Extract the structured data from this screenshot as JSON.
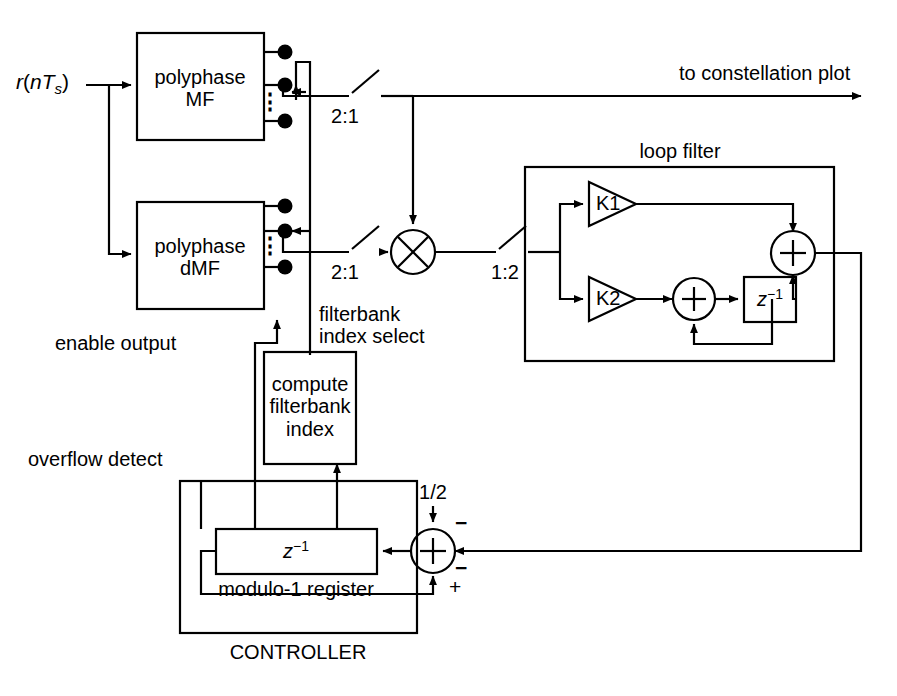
{
  "diagram": {
    "background_color": "#ffffff",
    "line_color": "#000000",
    "width": 897,
    "height": 696
  },
  "blocks": {
    "polyphase_mf": {
      "line1": "polyphase",
      "line2": "MF"
    },
    "polyphase_dmf": {
      "line1": "polyphase",
      "line2": "dMF"
    },
    "compute_index": {
      "line1": "compute",
      "line2": "filterbank",
      "line3": "index"
    },
    "gain_k1": {
      "label": "K1"
    },
    "gain_k2": {
      "label": "K2"
    },
    "delay_loop": {
      "base": "z",
      "exponent": "−1"
    },
    "delay_controller": {
      "base": "z",
      "exponent": "−1"
    }
  },
  "operators": {
    "multiplier": {
      "glyph": "×",
      "name": "multiplier"
    },
    "adder_loop_output": {
      "glyph": "+",
      "name": "summer"
    },
    "adder_loop_inner": {
      "glyph": "+",
      "name": "summer"
    },
    "adder_controller": {
      "glyph": "+",
      "name": "summer"
    }
  },
  "labels": {
    "input_signal": {
      "r": "r",
      "paren_open": "(",
      "n": "n",
      "T": "T",
      "s": "s",
      "paren_close": ")"
    },
    "to_constellation_plot": "to constellation plot",
    "loop_filter": "loop filter",
    "controller": "CONTROLLER",
    "modulo_register": "modulo-1 register",
    "filterbank_index_select_l1": "filterbank",
    "filterbank_index_select_l2": "index select",
    "enable_output": "enable output",
    "overflow_detect": "overflow detect",
    "downsample_top": "2:1",
    "downsample_bottom": "2:1",
    "upsample": "1:2",
    "one_half": "1/2",
    "sign_minus_top": "−",
    "sign_minus_right": "−",
    "sign_plus_bottom": "+",
    "vertical_dots_mf": "⋮",
    "vertical_dots_dmf": "⋮"
  }
}
